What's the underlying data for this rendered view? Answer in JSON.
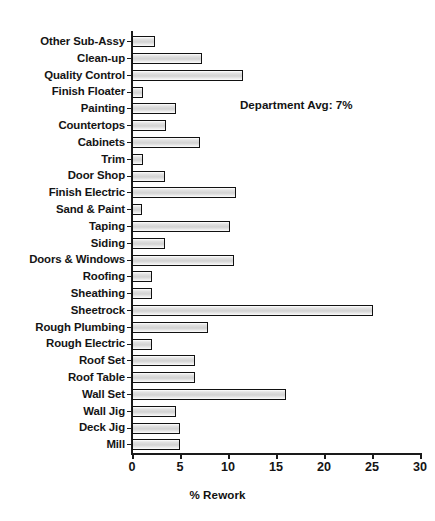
{
  "chart_data": {
    "type": "bar",
    "orientation": "horizontal",
    "title": "",
    "xlabel": "% Rework",
    "ylabel": "",
    "xlim": [
      0,
      30
    ],
    "xticks": [
      0,
      5,
      10,
      15,
      20,
      25,
      30
    ],
    "grid": false,
    "legend": null,
    "categories": [
      "Other Sub-Assy",
      "Clean-up",
      "Quality Control",
      "Finish Floater",
      "Painting",
      "Countertops",
      "Cabinets",
      "Trim",
      "Door Shop",
      "Finish Electric",
      "Sand & Paint",
      "Taping",
      "Siding",
      "Doors & Windows",
      "Roofing",
      "Sheathing",
      "Sheetrock",
      "Rough Plumbing",
      "Rough Electric",
      "Roof Set",
      "Roof Table",
      "Wall Set",
      "Wall Jig",
      "Deck Jig",
      "Mill"
    ],
    "values": [
      2.4,
      7.3,
      11.6,
      1.1,
      4.6,
      3.5,
      7.1,
      1.1,
      3.4,
      10.8,
      1.0,
      10.2,
      3.4,
      10.6,
      2.1,
      2.1,
      25.1,
      7.9,
      2.1,
      6.6,
      6.6,
      16.0,
      4.6,
      5.0,
      5.0
    ],
    "annotations": [
      {
        "text": "Department Avg: 7%",
        "x": 11.3,
        "y": 4.5
      }
    ],
    "colors": {
      "bar_fill": "#d9d9d9",
      "bar_border": "#111111",
      "axis": "#1a1a1a",
      "text": "#141414",
      "background": "#ffffff"
    }
  },
  "axis": {
    "x_title": "% Rework",
    "tick_labels": [
      "0",
      "5",
      "10",
      "15",
      "20",
      "25",
      "30"
    ]
  },
  "annotation": {
    "text": "Department Avg: 7%"
  }
}
